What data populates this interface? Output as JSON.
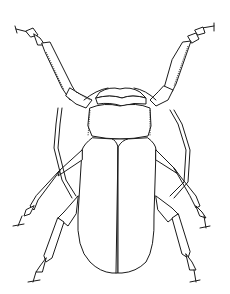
{
  "image": {
    "subject": "longhorn beetle line-art illustration",
    "style": "black outline on white, coloring page",
    "colors": {
      "background": "#ffffff",
      "outline": "#1a1a1a"
    },
    "parts": [
      "antenna-left",
      "antenna-right",
      "head",
      "pronotum",
      "scutellum",
      "elytra",
      "leg-front-left",
      "leg-front-right",
      "leg-mid-left",
      "leg-mid-right",
      "leg-hind-left",
      "leg-hind-right"
    ]
  }
}
